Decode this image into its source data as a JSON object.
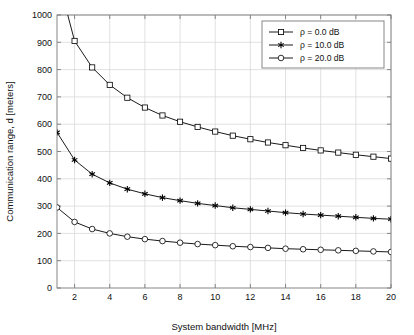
{
  "chart_data": {
    "type": "line",
    "title": "",
    "xlabel": "System bandwidth [MHz]",
    "ylabel": "Communication range, d [meters]",
    "xlim": [
      1,
      20
    ],
    "ylim": [
      0,
      1000
    ],
    "xticks": [
      2,
      4,
      6,
      8,
      10,
      12,
      14,
      16,
      18,
      20
    ],
    "xticklabels": [
      "2",
      "4",
      "6",
      "8",
      "10",
      "12",
      "14",
      "16",
      "18",
      "20"
    ],
    "yticks": [
      0,
      100,
      200,
      300,
      400,
      500,
      600,
      700,
      800,
      900,
      1000
    ],
    "yticklabels": [
      "0",
      "100",
      "200",
      "300",
      "400",
      "500",
      "600",
      "700",
      "800",
      "900",
      "1000"
    ],
    "grid": true,
    "legend_position": "upper right",
    "x": [
      1,
      2,
      3,
      4,
      5,
      6,
      7,
      8,
      9,
      10,
      11,
      12,
      13,
      14,
      15,
      16,
      17,
      18,
      19,
      20
    ],
    "series": [
      {
        "name": "ρ = 0.0 dB",
        "marker": "square",
        "color": "#000000",
        "values": [
          1150,
          905,
          808,
          744,
          697,
          661,
          632,
          609,
          590,
          573,
          558,
          545,
          533,
          523,
          513,
          504,
          496,
          488,
          481,
          474
        ]
      },
      {
        "name": "ρ = 10.0 dB",
        "marker": "star",
        "color": "#000000",
        "values": [
          570,
          469,
          417,
          385,
          362,
          345,
          331,
          320,
          310,
          302,
          294,
          288,
          282,
          276,
          271,
          267,
          263,
          259,
          255,
          252
        ]
      },
      {
        "name": "ρ = 20.0 dB",
        "marker": "circle",
        "color": "#000000",
        "values": [
          295,
          242,
          216,
          200,
          188,
          179,
          172,
          166,
          161,
          157,
          153,
          150,
          147,
          144,
          142,
          140,
          138,
          136,
          134,
          132
        ]
      }
    ],
    "legend_entries": [
      "ρ = 0.0 dB",
      "ρ = 10.0 dB",
      "ρ = 20.0 dB"
    ],
    "colors": {
      "line": "#000000",
      "grid": "#d4d4d4",
      "axis": "#7a7a7a",
      "background": "#ffffff",
      "legend_border": "#7a7a7a"
    }
  }
}
